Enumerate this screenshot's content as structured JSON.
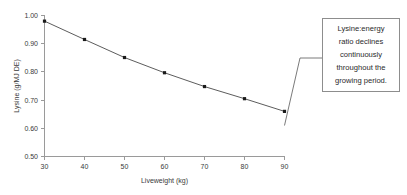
{
  "chart_data": {
    "type": "line",
    "title": "",
    "xlabel": "Liveweight (kg)",
    "ylabel": "Lysine (g/MJ DE)",
    "x": [
      30,
      40,
      50,
      60,
      70,
      80,
      90
    ],
    "values": [
      0.98,
      0.915,
      0.851,
      0.797,
      0.748,
      0.705,
      0.66
    ],
    "xticks": [
      "30",
      "40",
      "50",
      "60",
      "70",
      "80",
      "90"
    ],
    "yticks": [
      "0.50",
      "0.60",
      "0.70",
      "0.80",
      "0.90",
      "1.00"
    ],
    "xlim": [
      30,
      90
    ],
    "ylim": [
      0.5,
      1.0
    ],
    "grid": false,
    "legend": null,
    "marker": "square",
    "annotations": [
      {
        "name": "callout",
        "lines": [
          "Lysine:energy",
          "ratio declines",
          "continuously",
          "throughout the",
          "growing period."
        ],
        "anchor_x": 90,
        "anchor_y": 0.66
      }
    ]
  },
  "colors": {
    "background": "#ffffff",
    "axis": "#9a9a9a",
    "series": "#4a4a4a",
    "marker": "#1a1a1a",
    "text": "#3a3a3a",
    "callout_border": "#8d8d8d",
    "callout_fill": "#ffffff",
    "leader": "#6b6b6b"
  }
}
